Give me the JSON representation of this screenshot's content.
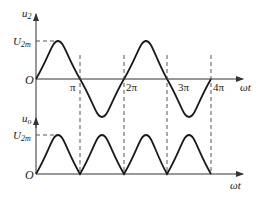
{
  "upper": {
    "y_label": "u",
    "y_label_sub": "2",
    "peak_label": "U",
    "peak_label_sub": "2m",
    "origin_label": "O",
    "x_ticks": [
      "π",
      "2π",
      "3π",
      "4π"
    ],
    "x_label": "ωt"
  },
  "lower": {
    "y_label": "u",
    "y_label_sub": "o",
    "peak_label": "U",
    "peak_label_sub": "2m",
    "origin_label": "O",
    "x_label": "ωt"
  },
  "colors": {
    "curve": "#1a1a1a",
    "axis": "#333333",
    "dash": "#444444"
  }
}
